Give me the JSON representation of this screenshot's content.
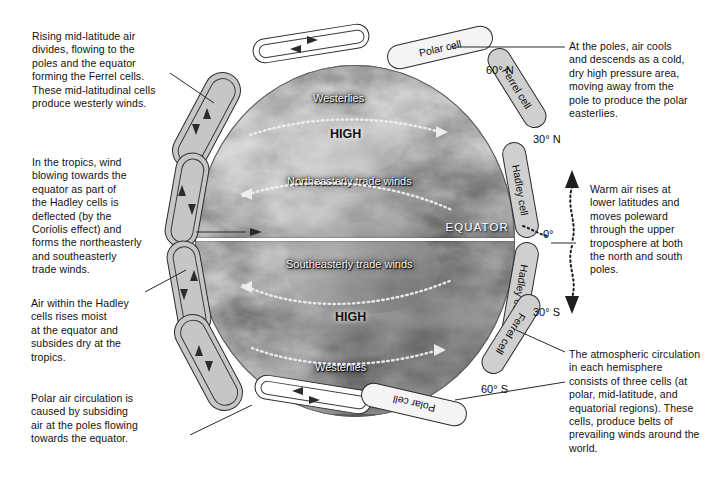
{
  "notes": [
    {
      "id": "note-ferrel-top-left",
      "text": "Rising mid-latitude air\ndivides, flowing to the\npoles and the equator\nforming the Ferrel cells.\nThese mid-latitudinal cells\nproduce westerly winds."
    },
    {
      "id": "note-tropics-left",
      "text": "In the tropics, wind\nblowing towards the\nequator as part of\nthe Hadley cells is\ndeflected (by the\nCoriolis effect) and\nforms the northeasterly\nand southeasterly\ntrade winds."
    },
    {
      "id": "note-hadley-moist-left",
      "text": "Air within the Hadley\ncells rises moist\nat the equator and\nsubsides dry at the\ntropics."
    },
    {
      "id": "note-polar-bottom-left",
      "text": "Polar air circulation is\ncaused by subsiding\nair at the poles flowing\ntowards the equator."
    },
    {
      "id": "note-poles-top-right",
      "text": "At the poles, air cools\nand descends as a cold,\ndry high pressure area,\nmoving away from the\npole to produce the polar\neasterlies."
    },
    {
      "id": "note-warm-air-right",
      "text": "Warm air rises at\nlower latitudes and\nmoves poleward\nthrough the upper\ntroposphere at both\nthe north and south\npoles."
    },
    {
      "id": "note-three-cells-right",
      "text": "The atmospheric circulation\nin each hemisphere\nconsists of three cells (at\npolar, mid-latitude, and\nequatorial regions). These\ncells, produce belts of\nprevailing winds around the\nworld."
    }
  ],
  "cell_labels": [
    {
      "id": "pill-polar-cell-north",
      "label": "Polar cell"
    },
    {
      "id": "pill-ferrel-cell-north",
      "label": "Ferrel cell"
    },
    {
      "id": "pill-hadley-cell-north",
      "label": "Hadley cell"
    },
    {
      "id": "pill-hadley-cell-south",
      "label": "Hadley cell"
    },
    {
      "id": "pill-ferrel-cell-south",
      "label": "Ferrel cell"
    },
    {
      "id": "pill-polar-cell-south",
      "label": "Polar cell"
    }
  ],
  "latitudes": [
    {
      "id": "lat-60n",
      "label": "60° N"
    },
    {
      "id": "lat-30n",
      "label": "30° N"
    },
    {
      "id": "lat-0",
      "label": "0°"
    },
    {
      "id": "lat-30s",
      "label": "30° S"
    },
    {
      "id": "lat-60s",
      "label": "60° S"
    }
  ],
  "globe_labels": [
    {
      "id": "label-westerlies-north",
      "label": "Westerlies",
      "style": "light"
    },
    {
      "id": "label-high-north",
      "label": "HIGH",
      "style": "dark"
    },
    {
      "id": "label-ne-trade-winds",
      "label": "Northeasterly trade winds",
      "style": "light"
    },
    {
      "id": "label-equator",
      "label": "EQUATOR",
      "style": "light"
    },
    {
      "id": "label-se-trade-winds",
      "label": "Southeasterly trade winds",
      "style": "light"
    },
    {
      "id": "label-high-south",
      "label": "HIGH",
      "style": "dark"
    },
    {
      "id": "label-westerlies-south",
      "label": "Westerlies",
      "style": "light"
    }
  ],
  "colors": {
    "background": "#ffffff",
    "ink": "#111111",
    "loop_fill": "#c6c6c6",
    "pill_fill": "#cfcfcf",
    "globe_base": "#8d8d8d",
    "equator_line": "#ffffff"
  }
}
